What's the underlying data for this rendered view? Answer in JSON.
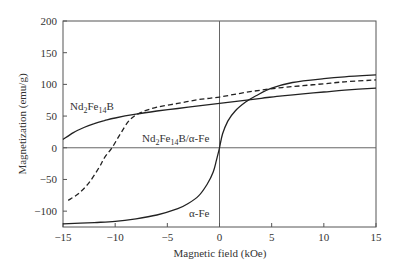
{
  "chart_data": {
    "type": "line",
    "title": "",
    "xlabel": "Magnetic field (kOe)",
    "ylabel": "Magnetization (emu/g)",
    "xlim": [
      -15,
      15
    ],
    "ylim": [
      -125,
      200
    ],
    "xticks": [
      -15,
      -10,
      -5,
      0,
      5,
      10,
      15
    ],
    "yticks": [
      -100,
      -50,
      0,
      50,
      100,
      150,
      200
    ],
    "grid": false,
    "zero_lines": true,
    "legend": "inline labels",
    "series": [
      {
        "name": "Nd2Fe14B",
        "style": "solid",
        "x": [
          -15,
          -14,
          -13,
          -12,
          -11,
          -10,
          -8,
          -6,
          -4,
          -2,
          0,
          2,
          4,
          6,
          8,
          10,
          12,
          15
        ],
        "y": [
          13,
          24,
          32,
          38,
          43,
          47,
          53,
          58,
          62,
          66,
          70,
          74,
          78,
          82,
          85,
          88,
          91,
          94
        ]
      },
      {
        "name": "Nd2Fe14B/α-Fe",
        "style": "dashed",
        "x": [
          -14.5,
          -13.5,
          -12.5,
          -11.5,
          -11,
          -10.3,
          -9.5,
          -8.6,
          -7.5,
          -6,
          -4,
          -2,
          0,
          2,
          4,
          6,
          8,
          10,
          12,
          15
        ],
        "y": [
          -83,
          -72,
          -55,
          -30,
          -15,
          0,
          22,
          44,
          56,
          64,
          70,
          76,
          80,
          86,
          91,
          95,
          98,
          101,
          104,
          107
        ]
      },
      {
        "name": "α-Fe",
        "style": "solid",
        "x": [
          -15,
          -12,
          -10,
          -8,
          -6,
          -4,
          -3,
          -2,
          -1.2,
          -0.6,
          -0.3,
          0,
          0.3,
          0.8,
          1.5,
          2.5,
          3.5,
          5,
          7,
          10,
          12,
          15
        ],
        "y": [
          -120,
          -118,
          -116,
          -112,
          -106,
          -96,
          -88,
          -76,
          -58,
          -38,
          -20,
          0,
          22,
          42,
          58,
          72,
          82,
          94,
          103,
          109,
          112,
          115
        ]
      }
    ],
    "annotations": [
      {
        "text": "Nd2Fe14B",
        "x": -14.5,
        "y": 65
      },
      {
        "text": "Nd2Fe14B/α-Fe",
        "x": -7.5,
        "y": 11
      },
      {
        "text": "α-Fe",
        "x": -3,
        "y": -110
      }
    ]
  },
  "labels": {
    "nd": {
      "base1": "Nd",
      "sub1": "2",
      "base2": "Fe",
      "sub2": "14",
      "base3": "B"
    },
    "ndfe": {
      "base1": "Nd",
      "sub1": "2",
      "base2": "Fe",
      "sub2": "14",
      "base3": "B/α-Fe"
    },
    "afe": "α-Fe"
  }
}
